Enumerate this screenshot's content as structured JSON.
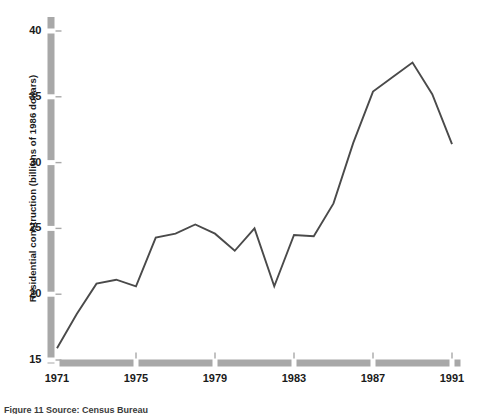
{
  "figure": {
    "caption": "Figure 11 Source: Census Bureau",
    "background_color": "#ffffff",
    "axis_color": "#a8a8a8",
    "line_color": "#4a4a4a",
    "text_color": "#1a1a1a"
  },
  "chart_data": {
    "type": "line",
    "title": "",
    "xlabel": "",
    "ylabel": "Residential construction (billions of 1986 dollars)",
    "xlim": [
      1971,
      1991
    ],
    "ylim": [
      15,
      40
    ],
    "grid": false,
    "legend": "none",
    "xticks": [
      1971,
      1975,
      1979,
      1983,
      1987,
      1991
    ],
    "xtick_labels": [
      "1971",
      "1975",
      "1979",
      "1983",
      "1987",
      "1991"
    ],
    "yticks": [
      15,
      20,
      25,
      30,
      35,
      40
    ],
    "ytick_labels": [
      "15",
      "20",
      "25",
      "30",
      "35",
      "40"
    ],
    "x": [
      1971,
      1972,
      1973,
      1974,
      1975,
      1976,
      1977,
      1978,
      1979,
      1980,
      1981,
      1982,
      1983,
      1984,
      1985,
      1986,
      1987,
      1988,
      1989,
      1990,
      1991
    ],
    "values": [
      15.9,
      18.5,
      20.8,
      21.1,
      20.6,
      24.3,
      24.6,
      25.3,
      24.6,
      23.3,
      25.0,
      20.6,
      24.5,
      24.4,
      26.9,
      31.5,
      35.4,
      36.5,
      37.6,
      35.2,
      31.4
    ],
    "series": [
      {
        "name": "Residential construction",
        "values": [
          15.9,
          18.5,
          20.8,
          21.1,
          20.6,
          24.3,
          24.6,
          25.3,
          24.6,
          23.3,
          25.0,
          20.6,
          24.5,
          24.4,
          26.9,
          31.5,
          35.4,
          36.5,
          37.6,
          35.2,
          31.4
        ]
      }
    ]
  }
}
